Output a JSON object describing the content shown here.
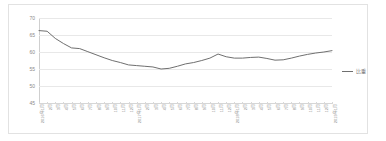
{
  "chart_data": {
    "type": "line",
    "title": "",
    "xlabel": "",
    "ylabel": "",
    "ylim": [
      45,
      70
    ],
    "y_ticks": [
      70,
      65,
      60,
      55,
      50,
      45
    ],
    "grid": true,
    "legend_position": "right",
    "series": [
      {
        "name": "比重",
        "color": "#6f6f6f",
        "values": [
          66.3,
          66.1,
          64.0,
          62.5,
          61.2,
          61.0,
          60.1,
          59.2,
          58.3,
          57.5,
          56.9,
          56.2,
          56.0,
          55.8,
          55.6,
          55.0,
          55.2,
          55.8,
          56.5,
          56.9,
          57.5,
          58.2,
          59.4,
          58.6,
          58.2,
          58.2,
          58.4,
          58.5,
          58.1,
          57.6,
          57.7,
          58.2,
          58.8,
          59.3,
          59.7,
          60.0,
          60.4
        ]
      }
    ],
    "categories": [
      "2016年1月",
      "2月",
      "3月",
      "4月",
      "5月",
      "6月",
      "7月",
      "8月",
      "9月",
      "10月",
      "11月",
      "12月",
      "2017年1月",
      "2月",
      "3月",
      "4月",
      "5月",
      "6月",
      "7月",
      "8月",
      "9月",
      "10月",
      "11月",
      "12月",
      "2018年1月",
      "2月",
      "3月",
      "4月",
      "5月",
      "6月",
      "7月",
      "8月",
      "9月",
      "10月",
      "11月",
      "12月",
      "2019年1月"
    ],
    "legend": [
      "比重"
    ]
  },
  "colors": {
    "series_line": "#6f6f6f",
    "gridline": "#e8e8e8",
    "axis": "#cfcfcf",
    "frame_border": "#e2e2e2",
    "tick_text": "#8a8a8a",
    "background": "#ffffff"
  }
}
